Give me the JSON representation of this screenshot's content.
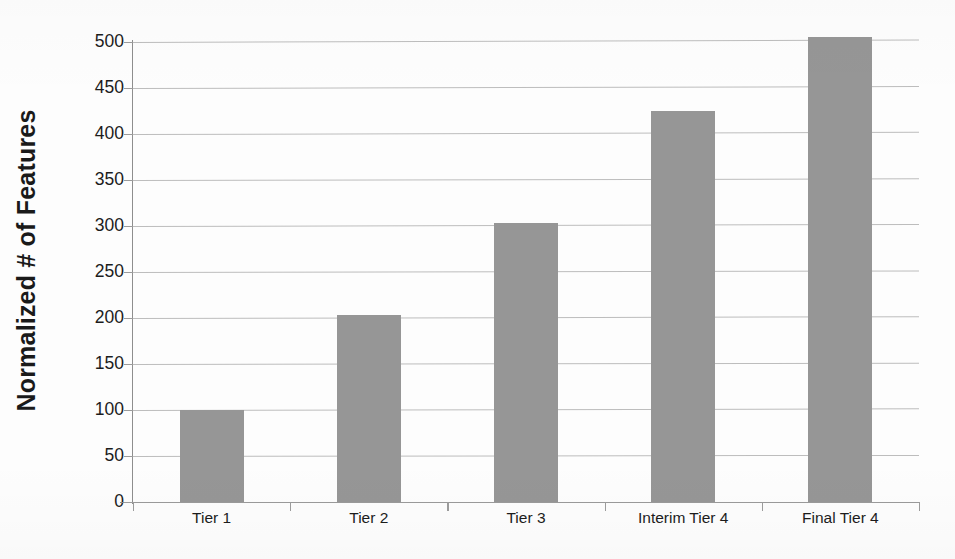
{
  "chart_data": {
    "type": "bar",
    "title": "",
    "xlabel": "",
    "ylabel": "Normalized # of Features",
    "categories": [
      "Tier 1",
      "Tier 2",
      "Tier 3",
      "Interim Tier 4",
      "Final Tier 4"
    ],
    "values": [
      100,
      203,
      303,
      425,
      505
    ],
    "ylim": [
      0,
      500
    ],
    "ytick_labels": [
      "500",
      "450",
      "400",
      "350",
      "300",
      "250",
      "200",
      "150",
      "100",
      "50",
      "0"
    ],
    "ytick_values": [
      500,
      450,
      400,
      350,
      300,
      250,
      200,
      150,
      100,
      50,
      0
    ],
    "grid": true,
    "legend": false,
    "legend_position": "none",
    "bar_color": "#969696",
    "gridline_color": "#bdbdbd",
    "axis_color": "#8e8e8e",
    "background_color": "#ffffff",
    "text_color": "#1c1c1c"
  }
}
